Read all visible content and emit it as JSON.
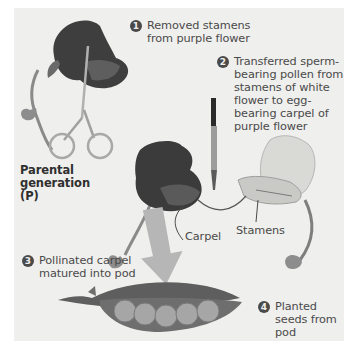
{
  "diagram": {
    "steps": [
      {
        "number": "1",
        "text_lines": [
          "Removed stamens",
          "from purple flower"
        ]
      },
      {
        "number": "2",
        "text_lines": [
          "Transferred sperm-",
          "bearing pollen from",
          "stamens of white",
          "flower to egg-",
          "bearing carpel of",
          "purple flower"
        ]
      },
      {
        "number": "3",
        "text_lines": [
          "Pollinated carpel",
          "matured into pod"
        ]
      },
      {
        "number": "4",
        "text_lines": [
          "Planted",
          "seeds from",
          "pod"
        ]
      }
    ],
    "generation_label": [
      "Parental",
      "generation",
      "(P)"
    ],
    "labels": {
      "carpel": "Carpel",
      "stamens": "Stamens"
    },
    "illustrations": [
      "purple-flower-with-scissors",
      "paintbrush",
      "purple-flower",
      "white-flower",
      "arrow-down",
      "pea-pod-with-seeds"
    ],
    "colors": {
      "panel_bg": "#efefed",
      "text": "#4a4a4a",
      "badge": "#4a4a4a",
      "purple_flower": "#3b3b3b",
      "white_flower": "#d9d9d6",
      "pod": "#6e6e6e",
      "pea": "#a6a6a6"
    }
  }
}
